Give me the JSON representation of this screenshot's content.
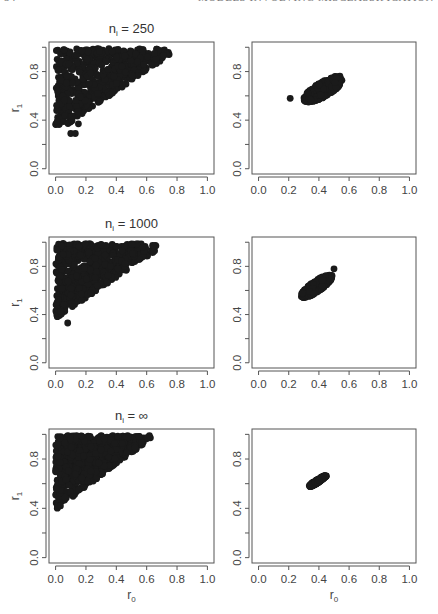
{
  "page_header": {
    "page_number": "54",
    "running_title": "MODELS INVOLVING MISCLASSIFICATION"
  },
  "chart_data": [
    {
      "type": "scatter",
      "panel": "row1-left",
      "title": "n_i = 250",
      "title_main": "n",
      "title_sub": "i",
      "title_rest": " = 250",
      "xlabel": "",
      "ylabel": "r1",
      "xlim": [
        0,
        1
      ],
      "ylim": [
        0,
        1
      ],
      "xticks": [
        "0.0",
        "0.2",
        "0.4",
        "0.6",
        "0.8",
        "1.0"
      ],
      "yticks": [
        "0.0",
        "0.4",
        "0.8"
      ],
      "description": "Wide wedge-shaped cloud; r0 from ~0.0 to ~0.75, r1 from ~0.28 to ~1.0, positively correlated",
      "cloud": {
        "kind": "wedge",
        "x_min": 0.0,
        "x_max": 0.75,
        "y_low_at_x0": 0.3,
        "y_low_slope": 0.85,
        "y_max": 1.0,
        "n": 600,
        "seed": 11,
        "outliers": [
          [
            0.1,
            0.29
          ],
          [
            0.13,
            0.29
          ],
          [
            0.15,
            0.37
          ]
        ]
      }
    },
    {
      "type": "scatter",
      "panel": "row1-right",
      "title": "",
      "xlabel": "",
      "ylabel": "",
      "xlim": [
        0,
        1
      ],
      "ylim": [
        0,
        1
      ],
      "xticks": [
        "0.0",
        "0.2",
        "0.4",
        "0.6",
        "0.8",
        "1.0"
      ],
      "yticks": [
        "0.0",
        "0.4",
        "0.8"
      ],
      "description": "Compact elliptical cluster centred near (0.42, 0.65), spanning r0 0.27–0.60, r1 0.48–0.83; one outlier at (0.21, 0.58)",
      "cloud": {
        "kind": "ellipse",
        "cx": 0.43,
        "cy": 0.655,
        "rx": 0.16,
        "ry": 0.055,
        "angle_deg": 38,
        "n": 400,
        "seed": 23,
        "outliers": [
          [
            0.21,
            0.58
          ]
        ]
      }
    },
    {
      "type": "scatter",
      "panel": "row2-left",
      "title": "n_i = 1000",
      "title_main": "n",
      "title_sub": "i",
      "title_rest": " = 1000",
      "xlabel": "",
      "ylabel": "r1",
      "xlim": [
        0,
        1
      ],
      "ylim": [
        0,
        1
      ],
      "xticks": [
        "0.0",
        "0.2",
        "0.4",
        "0.6",
        "0.8",
        "1.0"
      ],
      "yticks": [
        "0.0",
        "0.4",
        "0.8"
      ],
      "description": "Wedge-shaped cloud; r0 from ~0.0 to ~0.67, r1 from ~0.33 to ~1.0",
      "cloud": {
        "kind": "wedge",
        "x_min": 0.0,
        "x_max": 0.67,
        "y_low_at_x0": 0.37,
        "y_low_slope": 0.85,
        "y_max": 1.0,
        "n": 650,
        "seed": 37,
        "outliers": [
          [
            0.08,
            0.33
          ],
          [
            0.05,
            0.9
          ]
        ]
      }
    },
    {
      "type": "scatter",
      "panel": "row2-right",
      "title": "",
      "xlabel": "",
      "ylabel": "",
      "xlim": [
        0,
        1
      ],
      "ylim": [
        0,
        1
      ],
      "xticks": [
        "0.0",
        "0.2",
        "0.4",
        "0.6",
        "0.8",
        "1.0"
      ],
      "yticks": [
        "0.0",
        "0.4",
        "0.8"
      ],
      "description": "Tighter elliptical cluster centred near (0.38, 0.63), spanning r0 0.26–0.52, r1 0.50–0.78",
      "cloud": {
        "kind": "ellipse",
        "cx": 0.385,
        "cy": 0.635,
        "rx": 0.135,
        "ry": 0.04,
        "angle_deg": 42,
        "n": 350,
        "seed": 41,
        "outliers": [
          [
            0.5,
            0.78
          ]
        ]
      }
    },
    {
      "type": "scatter",
      "panel": "row3-left",
      "title": "n_i = ∞",
      "title_main": "n",
      "title_sub": "i",
      "title_rest": " = ∞",
      "xlabel": "r0",
      "ylabel": "r1",
      "xlim": [
        0,
        1
      ],
      "ylim": [
        0,
        1
      ],
      "xticks": [
        "0.0",
        "0.2",
        "0.4",
        "0.6",
        "0.8",
        "1.0"
      ],
      "yticks": [
        "0.0",
        "0.4",
        "0.8"
      ],
      "description": "Dense wedge; r0 0.0–0.66, r1 0.38–1.0 with sharp lower boundary r1 ≈ 0.40 + 0.9·r0",
      "cloud": {
        "kind": "wedge",
        "x_min": 0.0,
        "x_max": 0.66,
        "y_low_at_x0": 0.39,
        "y_low_slope": 0.92,
        "y_max": 1.0,
        "n": 750,
        "seed": 53,
        "outliers": []
      }
    },
    {
      "type": "scatter",
      "panel": "row3-right",
      "title": "",
      "xlabel": "r0",
      "ylabel": "",
      "xlim": [
        0,
        1
      ],
      "ylim": [
        0,
        1
      ],
      "xticks": [
        "0.0",
        "0.2",
        "0.4",
        "0.6",
        "0.8",
        "1.0"
      ],
      "yticks": [
        "0.0",
        "0.4",
        "0.8"
      ],
      "description": "Very thin elongated cluster from (0.33, 0.57) to (0.45, 0.67)",
      "cloud": {
        "kind": "ellipse",
        "cx": 0.39,
        "cy": 0.62,
        "rx": 0.075,
        "ry": 0.012,
        "angle_deg": 38,
        "n": 200,
        "seed": 67,
        "outliers": []
      }
    }
  ],
  "layout": {
    "columns_x": [
      [
        49,
        214
      ],
      [
        252,
        416
      ]
    ],
    "rows_y": [
      [
        42,
        174
      ],
      [
        237,
        368
      ],
      [
        429,
        563
      ]
    ],
    "point_color": "#1a1a1a",
    "frame_color": "#555555"
  }
}
